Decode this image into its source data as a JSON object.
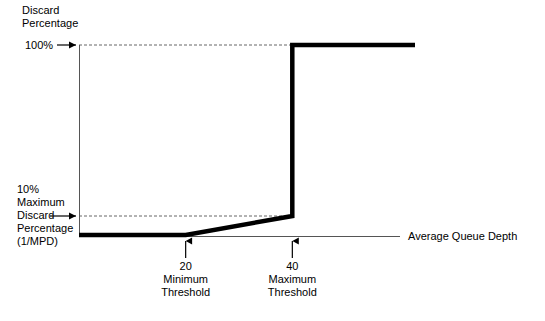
{
  "chart_data": {
    "type": "line",
    "xlabel": "Average Queue Depth",
    "ylabel": "Discard Percentage",
    "xlim": [
      0,
      63
    ],
    "ylim": [
      0,
      110
    ],
    "grid": false,
    "legend": "none",
    "series": [
      {
        "name": "Discard probability",
        "x": [
          0,
          20,
          40,
          40,
          63
        ],
        "y": [
          0,
          0,
          10,
          100,
          100
        ]
      }
    ],
    "y_ticks": [
      {
        "value": 100,
        "label": "100%"
      },
      {
        "value": 10,
        "label": "10%"
      }
    ],
    "x_ticks": [
      {
        "value": 20,
        "label": "20"
      },
      {
        "value": 40,
        "label": "40"
      }
    ],
    "annotations": [
      {
        "at_x": 20,
        "text": "Minimum Threshold"
      },
      {
        "at_x": 40,
        "text": "Maximum Threshold"
      },
      {
        "at_y": 10,
        "text": "Maximum Discard Percentage (1/MPD)"
      }
    ],
    "guide_lines": [
      {
        "y": 100,
        "style": "dashed"
      },
      {
        "y": 10,
        "style": "dashed"
      }
    ]
  },
  "labels": {
    "title_line1": "Discard",
    "title_line2": "Percentage",
    "y_tick_100": "100%",
    "y_tick_10": "10%",
    "y_note_line1": "Maximum",
    "y_note_line2": "Discard",
    "y_note_line3": "Percentage",
    "y_note_line4": "(1/MPD)",
    "x_axis_title": "Average Queue Depth",
    "tick_min_value": "20",
    "tick_min_line1": "Minimum",
    "tick_min_line2": "Threshold",
    "tick_max_value": "40",
    "tick_max_line1": "Maximum",
    "tick_max_line2": "Threshold"
  },
  "colors": {
    "curve": "#000000",
    "axis": "#555555",
    "guide": "#666666",
    "background": "#ffffff",
    "text": "#000000"
  }
}
